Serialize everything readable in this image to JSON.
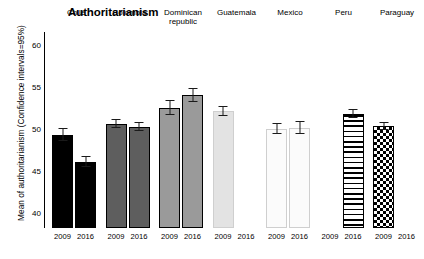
{
  "chart_data": {
    "type": "bar",
    "title": "Authoritarianism",
    "xlabel": "",
    "ylabel": "Mean of authoritarianism (Confidence intervals=95%)",
    "ylim": [
      38.2,
      61.5
    ],
    "yticks": [
      40,
      45,
      50,
      55,
      60
    ],
    "grid": false,
    "legend": null,
    "categories": [
      "Chile",
      "Colombia",
      "Dominican republic",
      "Guatemala",
      "Mexico",
      "Peru",
      "Paraguay"
    ],
    "x": [
      "2009",
      "2016"
    ],
    "series": [
      {
        "name": "2009",
        "values": [
          49.3,
          50.6,
          52.5,
          52.1,
          50.0,
          null,
          50.3
        ],
        "ci_low": [
          48.6,
          50.1,
          51.6,
          51.5,
          49.4,
          null,
          49.9
        ],
        "ci_high": [
          50.1,
          51.1,
          53.4,
          52.7,
          50.7,
          null,
          50.8
        ]
      },
      {
        "name": "2016",
        "values": [
          46.0,
          50.2,
          54.0,
          null,
          50.1,
          51.8,
          null
        ],
        "ci_low": [
          45.4,
          49.7,
          53.2,
          null,
          49.4,
          51.3,
          null
        ],
        "ci_high": [
          46.7,
          50.8,
          54.8,
          null,
          50.9,
          52.3,
          null
        ]
      }
    ],
    "bar_colors": {
      "Chile": "#000000",
      "Colombia": "#5e5e5e",
      "Dominican republic": "#9a9a9a",
      "Guatemala": "#e3e3e3",
      "Mexico": "#fbfbfb",
      "Peru": "stripe-horizontal",
      "Paraguay": "checkerboard"
    }
  },
  "axis": {
    "ytick_labels": [
      "60",
      "55",
      "50",
      "45",
      "40"
    ],
    "xtick_label_2009": "2009",
    "xtick_label_2016": "2016"
  },
  "groups": [
    {
      "label": "Chile",
      "bars": [
        {
          "year": "2009",
          "value": 49.3
        },
        {
          "year": "2016",
          "value": 46.0
        }
      ]
    },
    {
      "label": "Colombia",
      "bars": [
        {
          "year": "2009",
          "value": 50.6
        },
        {
          "year": "2016",
          "value": 50.2
        }
      ]
    },
    {
      "label": "Dominican\nrepublic",
      "bars": [
        {
          "year": "2009",
          "value": 52.5
        },
        {
          "year": "2016",
          "value": 54.0
        }
      ]
    },
    {
      "label": "Guatemala",
      "bars": [
        {
          "year": "2009",
          "value": 52.1
        },
        {
          "year": "2016",
          "value": null
        }
      ]
    },
    {
      "label": "Mexico",
      "bars": [
        {
          "year": "2009",
          "value": 50.0
        },
        {
          "year": "2016",
          "value": 50.1
        }
      ]
    },
    {
      "label": "Peru",
      "bars": [
        {
          "year": "2009",
          "value": null
        },
        {
          "year": "2016",
          "value": 51.8
        }
      ]
    },
    {
      "label": "Paraguay",
      "bars": [
        {
          "year": "2009",
          "value": 50.3
        },
        {
          "year": "2016",
          "value": null
        }
      ]
    }
  ]
}
